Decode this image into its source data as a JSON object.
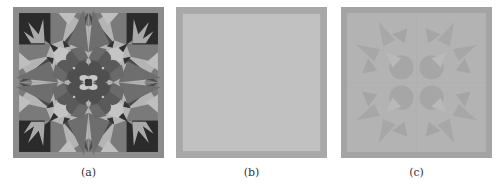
{
  "figure": {
    "panels": [
      {
        "id": "a",
        "caption": "(a)",
        "description": "Original quilt-like kaleidoscope pattern in grayscale",
        "colors": {
          "border": "#8c8c8c",
          "background": "#b4b4b4",
          "corner_square": "#2b2b2b",
          "bird_foot": "#a9a9a9",
          "star_dark": "#4a4a4a",
          "star_mid": "#6e6e6e",
          "flower": "#5a5a5a",
          "flower_dark": "#3c3c3c",
          "center_light": "#c8c8c8"
        }
      },
      {
        "id": "b",
        "caption": "(b)",
        "description": "Nearly uniform gray square with darker frame",
        "colors": {
          "border": "#a8a8a8",
          "fill": "#c1c1c1"
        }
      },
      {
        "id": "c",
        "caption": "(c)",
        "description": "Faint, low-contrast reconstruction of the pattern",
        "colors": {
          "border": "#a4a4a4",
          "fill": "#b3b3b3",
          "shape": "#a6a6a6",
          "shape_light": "#bababa"
        }
      }
    ]
  }
}
